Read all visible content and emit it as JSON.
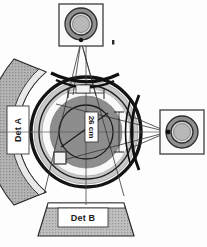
{
  "figure": {
    "background_color": "#fdfdfd",
    "width": 207,
    "height": 247
  },
  "palette": {
    "ink": "#1a1a1a",
    "outline": "#2b2b2b",
    "mid_gray": "#a8a8a8",
    "dark_gray": "#7d7d7d",
    "light_gray": "#d6d6d6",
    "pale_gray": "#efefef",
    "white": "#ffffff",
    "hatch_gray": "#9b9b9b"
  },
  "sources": {
    "top": {
      "name": "top-source-module",
      "box": {
        "x": 59,
        "y": 4,
        "w": 44,
        "h": 42
      },
      "rings": [
        {
          "r": 16,
          "fill": "#8f8f8f"
        },
        {
          "r": 11,
          "fill": "#d9d9d9"
        },
        {
          "r": 9,
          "fill": "#b9b9b9"
        }
      ],
      "marker_dot": {
        "x": 113,
        "y": 42,
        "w": 2,
        "h": 4
      }
    },
    "right": {
      "name": "right-source-module",
      "box": {
        "x": 160,
        "y": 110,
        "w": 44,
        "h": 44
      },
      "rings": [
        {
          "r": 16,
          "fill": "#8f8f8f"
        },
        {
          "r": 11,
          "fill": "#d9d9d9"
        },
        {
          "r": 9,
          "fill": "#b9b9b9"
        }
      ]
    }
  },
  "detectors": [
    {
      "id": "det-a",
      "label": "Det A",
      "orientation": "vertical",
      "shape": "curved-arc-band",
      "label_box": {
        "x": 9,
        "y": 108,
        "w": 18,
        "h": 42
      }
    },
    {
      "id": "det-b",
      "label": "Det B",
      "orientation": "horizontal",
      "shape": "trapezoid-band",
      "label_box": {
        "x": 60,
        "y": 208,
        "w": 44,
        "h": 17
      }
    }
  ],
  "sample": {
    "name": "central-sample-vessel",
    "center": {
      "x": 86,
      "y": 132
    },
    "rings": [
      {
        "id": "outer-heavy-ring",
        "r": 56,
        "stroke_width": 3.5,
        "fill": "none"
      },
      {
        "id": "outer-gray-annulus",
        "r": 52,
        "fill": "#c9c9c9"
      },
      {
        "id": "white-gap-ring",
        "r": 44,
        "fill": "#f7f7f7"
      },
      {
        "id": "inner-dark-disk",
        "r": 36,
        "fill": "#8d8d8d"
      },
      {
        "id": "inner-circle-outline",
        "r": 27,
        "fill": "none"
      }
    ],
    "dimension": {
      "label": "26 cm",
      "orientation": "rotated",
      "from": {
        "x": 62,
        "y": 145
      },
      "to": {
        "x": 104,
        "y": 116
      }
    },
    "sample_cell": {
      "x": 55,
      "y": 153,
      "w": 11,
      "h": 11
    }
  },
  "optics": [
    {
      "id": "top-lens",
      "type": "curved-collimator",
      "orientation": "horizontal"
    },
    {
      "id": "right-lens",
      "type": "curved-collimator",
      "orientation": "vertical"
    }
  ],
  "beams": [
    {
      "id": "top-beam-cone",
      "from": "top-source-module",
      "to": "central-sample-vessel"
    },
    {
      "id": "right-beam-cone",
      "from": "right-source-module",
      "to": "central-sample-vessel"
    }
  ],
  "axes": [
    {
      "id": "horizontal-center-axis",
      "y": 132
    },
    {
      "id": "vertical-center-axis",
      "x": 86
    }
  ]
}
